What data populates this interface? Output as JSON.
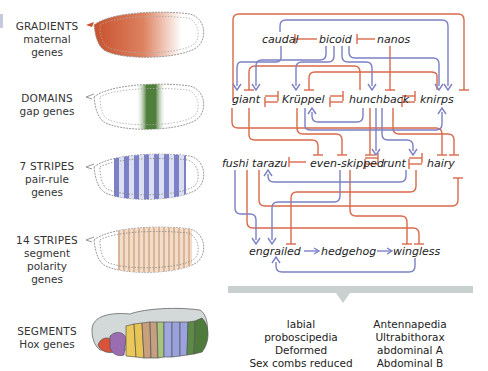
{
  "stages": [
    {
      "title": "GRADIENTS",
      "subtitle": [
        "maternal",
        "genes"
      ]
    },
    {
      "title": "DOMAINS",
      "subtitle": [
        "gap genes"
      ]
    },
    {
      "title": "7 STRIPES",
      "subtitle": [
        "pair-rule",
        "genes"
      ]
    },
    {
      "title": "14 STRIPES",
      "subtitle": [
        "segment",
        "polarity",
        "genes"
      ]
    },
    {
      "title": "SEGMENTS",
      "subtitle": [
        "Hox genes"
      ]
    }
  ],
  "genes": {
    "maternal": [
      "caudal",
      "bicoid",
      "nanos"
    ],
    "gap": [
      "giant",
      "Krüppel",
      "hunchback",
      "knirps"
    ],
    "pair_rule": [
      "fushi tarazu",
      "even-skipped",
      "runt",
      "hairy"
    ],
    "segment_polarity": [
      "engrailed",
      "hedgehog",
      "wingless"
    ]
  },
  "hox_genes": {
    "left": [
      "labial",
      "proboscipedia",
      "Deformed",
      "Sex combs reduced"
    ],
    "right": [
      "Antennapedia",
      "Ultrabithorax",
      "abdominal A",
      "Abdominal B"
    ]
  },
  "colors": {
    "repression": "#d9694a",
    "activation": "#7b80c4",
    "maternal_gradient": "#c9502c",
    "gap_domain": "#4f7f3a",
    "pair_rule_stripe": "#6d72c0",
    "segment_stripe": "#e5c5aa",
    "hox_bar": "#c8d0d0"
  },
  "legend_sense": {
    "red": "repression",
    "blue": "activation"
  }
}
